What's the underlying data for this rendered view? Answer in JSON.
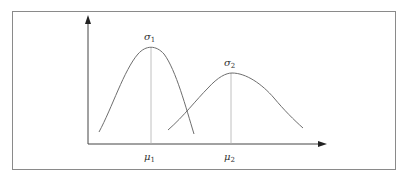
{
  "top_caption": "",
  "diagram": {
    "type": "two-normal-distributions",
    "axes": {
      "x_axis": "horizontal arrow",
      "y_axis": "vertical arrow"
    },
    "curves": [
      {
        "id": "curve-1",
        "peak_label": "σ",
        "peak_label_sub": "1",
        "mean_label": "μ",
        "mean_label_sub": "1"
      },
      {
        "id": "curve-2",
        "peak_label": "σ",
        "peak_label_sub": "2",
        "mean_label": "μ",
        "mean_label_sub": "2"
      }
    ]
  },
  "colors": {
    "curve": "#6e6e6e",
    "axis": "#333333",
    "frame": "#8a8a8a",
    "guide": "#b0b0b0"
  }
}
